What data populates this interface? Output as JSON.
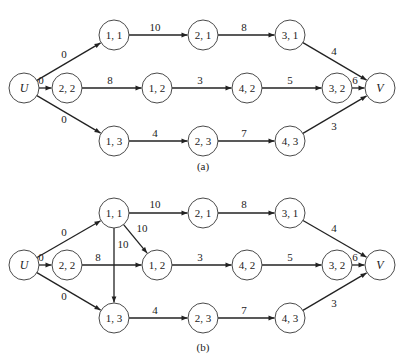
{
  "style": {
    "line_color": "#222222",
    "node_stroke": "#4a4a4a",
    "background": "#ffffff",
    "node_radius": 15
  },
  "panels": [
    {
      "id": "a",
      "caption": "(a)",
      "caption_pos": [
        203,
        170
      ],
      "nodes": [
        {
          "id": "U",
          "label": "U",
          "x": 24,
          "y": 88,
          "italic": true
        },
        {
          "id": "11",
          "label": "1, 1",
          "x": 114,
          "y": 35
        },
        {
          "id": "22",
          "label": "2, 2",
          "x": 67,
          "y": 88
        },
        {
          "id": "13",
          "label": "1, 3",
          "x": 114,
          "y": 141
        },
        {
          "id": "21",
          "label": "2, 1",
          "x": 203,
          "y": 35
        },
        {
          "id": "12",
          "label": "1, 2",
          "x": 157,
          "y": 88
        },
        {
          "id": "23",
          "label": "2, 3",
          "x": 203,
          "y": 141
        },
        {
          "id": "31",
          "label": "3, 1",
          "x": 290,
          "y": 35
        },
        {
          "id": "42",
          "label": "4, 2",
          "x": 247,
          "y": 88
        },
        {
          "id": "43",
          "label": "4, 3",
          "x": 290,
          "y": 141
        },
        {
          "id": "32",
          "label": "3, 2",
          "x": 337,
          "y": 88
        },
        {
          "id": "V",
          "label": "V",
          "x": 380,
          "y": 88,
          "italic": true
        }
      ],
      "edges": [
        {
          "from": "U",
          "to": "11",
          "label": "0",
          "lx": 64,
          "ly": 58
        },
        {
          "from": "U",
          "to": "22",
          "label": "0",
          "lx": 41,
          "ly": 84
        },
        {
          "from": "U",
          "to": "13",
          "label": "0",
          "lx": 64,
          "ly": 123
        },
        {
          "from": "11",
          "to": "21",
          "label": "10",
          "lx": 155,
          "ly": 31
        },
        {
          "from": "22",
          "to": "12",
          "label": "8",
          "lx": 110,
          "ly": 84
        },
        {
          "from": "13",
          "to": "23",
          "label": "4",
          "lx": 155,
          "ly": 137
        },
        {
          "from": "21",
          "to": "31",
          "label": "8",
          "lx": 244,
          "ly": 31
        },
        {
          "from": "12",
          "to": "42",
          "label": "3",
          "lx": 200,
          "ly": 84
        },
        {
          "from": "23",
          "to": "43",
          "label": "7",
          "lx": 244,
          "ly": 137
        },
        {
          "from": "31",
          "to": "V",
          "label": "4",
          "lx": 334,
          "ly": 55
        },
        {
          "from": "42",
          "to": "32",
          "label": "5",
          "lx": 290,
          "ly": 84
        },
        {
          "from": "32",
          "to": "V",
          "label": "6",
          "lx": 355,
          "ly": 84
        },
        {
          "from": "43",
          "to": "V",
          "label": "3",
          "lx": 334,
          "ly": 130
        }
      ]
    },
    {
      "id": "b",
      "caption": "(b)",
      "caption_pos": [
        203,
        351
      ],
      "nodes": [
        {
          "id": "U",
          "label": "U",
          "x": 24,
          "y": 265,
          "italic": true
        },
        {
          "id": "11",
          "label": "1, 1",
          "x": 114,
          "y": 213
        },
        {
          "id": "22",
          "label": "2, 2",
          "x": 67,
          "y": 265
        },
        {
          "id": "13",
          "label": "1, 3",
          "x": 114,
          "y": 318
        },
        {
          "id": "21",
          "label": "2, 1",
          "x": 203,
          "y": 213
        },
        {
          "id": "12",
          "label": "1, 2",
          "x": 157,
          "y": 265
        },
        {
          "id": "23",
          "label": "2, 3",
          "x": 203,
          "y": 318
        },
        {
          "id": "31",
          "label": "3, 1",
          "x": 290,
          "y": 213
        },
        {
          "id": "42",
          "label": "4, 2",
          "x": 247,
          "y": 265
        },
        {
          "id": "43",
          "label": "4, 3",
          "x": 290,
          "y": 318
        },
        {
          "id": "32",
          "label": "3, 2",
          "x": 337,
          "y": 265
        },
        {
          "id": "V",
          "label": "V",
          "x": 380,
          "y": 265,
          "italic": true
        }
      ],
      "edges": [
        {
          "from": "U",
          "to": "11",
          "label": "0",
          "lx": 64,
          "ly": 236
        },
        {
          "from": "U",
          "to": "22",
          "label": "0",
          "lx": 41,
          "ly": 261
        },
        {
          "from": "U",
          "to": "13",
          "label": "0",
          "lx": 64,
          "ly": 300
        },
        {
          "from": "11",
          "to": "21",
          "label": "10",
          "lx": 155,
          "ly": 208
        },
        {
          "from": "11",
          "to": "12",
          "label": "10",
          "lx": 142,
          "ly": 232
        },
        {
          "from": "11",
          "to": "13",
          "label": "10",
          "lx": 123,
          "ly": 248
        },
        {
          "from": "22",
          "to": "12",
          "label": "8",
          "lx": 98,
          "ly": 261
        },
        {
          "from": "13",
          "to": "23",
          "label": "4",
          "lx": 155,
          "ly": 314
        },
        {
          "from": "21",
          "to": "31",
          "label": "8",
          "lx": 244,
          "ly": 208
        },
        {
          "from": "12",
          "to": "42",
          "label": "3",
          "lx": 200,
          "ly": 261
        },
        {
          "from": "23",
          "to": "43",
          "label": "7",
          "lx": 244,
          "ly": 314
        },
        {
          "from": "31",
          "to": "V",
          "label": "4",
          "lx": 334,
          "ly": 232
        },
        {
          "from": "42",
          "to": "32",
          "label": "5",
          "lx": 290,
          "ly": 261
        },
        {
          "from": "32",
          "to": "V",
          "label": "6",
          "lx": 355,
          "ly": 261
        },
        {
          "from": "43",
          "to": "V",
          "label": "3",
          "lx": 334,
          "ly": 307
        }
      ]
    }
  ]
}
